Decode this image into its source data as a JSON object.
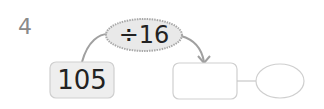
{
  "problem_number": "4",
  "operation": {
    "label": "÷16"
  },
  "start_value": "105",
  "quotient_box": "",
  "remainder_circle": "",
  "colors": {
    "operation_fill": "#e9e9e9",
    "start_fill": "#eeeeee",
    "outline": "#c8c8c8",
    "arrow": "#9a9a9a",
    "number": "#8a8a8a"
  }
}
